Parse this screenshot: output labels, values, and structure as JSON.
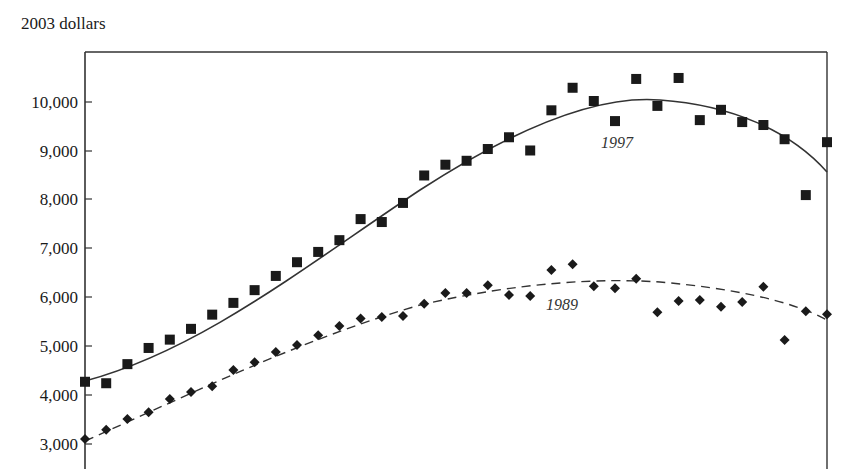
{
  "chart_data": {
    "type": "scatter",
    "title": "",
    "ylabel": "2003 dollars",
    "xlabel": "",
    "ylim": [
      3000,
      11000
    ],
    "yticks": [
      3000,
      4000,
      5000,
      6000,
      7000,
      8000,
      9000,
      10000
    ],
    "ytick_labels": [
      "3,000",
      "4,000",
      "5,000",
      "6,000",
      "7,000",
      "8,000",
      "9,000",
      "10,000"
    ],
    "grid": false,
    "x_index": [
      1,
      2,
      3,
      4,
      5,
      6,
      7,
      8,
      9,
      10,
      11,
      12,
      13,
      14,
      15,
      16,
      17,
      18,
      19,
      20,
      21,
      22,
      23,
      24,
      25,
      26,
      27,
      28,
      29,
      30,
      31,
      32,
      33,
      34,
      35
    ],
    "series": [
      {
        "name": "1997",
        "marker": "square",
        "fit_line": "solid",
        "values": [
          4270,
          4240,
          4630,
          4960,
          5130,
          5350,
          5640,
          5880,
          6140,
          6430,
          6710,
          6920,
          7160,
          7590,
          7530,
          7920,
          8480,
          8700,
          8780,
          9020,
          9260,
          8990,
          9810,
          10270,
          10000,
          9590,
          10450,
          9900,
          10470,
          9610,
          9820,
          9570,
          9510,
          9220,
          8080,
          9160
        ]
      },
      {
        "name": "1989",
        "marker": "diamond",
        "fit_line": "dashed",
        "values": [
          3100,
          3290,
          3510,
          3650,
          3920,
          4060,
          4180,
          4510,
          4670,
          4880,
          5020,
          5220,
          5410,
          5560,
          5590,
          5610,
          5860,
          6080,
          6080,
          6240,
          6040,
          6020,
          6550,
          6670,
          6220,
          6180,
          6370,
          5690,
          5920,
          5940,
          5800,
          5900,
          6210,
          5120,
          5710,
          5650
        ]
      }
    ],
    "annotations": [
      {
        "text": "1997",
        "series": "1997"
      },
      {
        "text": "1989",
        "series": "1989"
      }
    ]
  },
  "header": {
    "unit_label": "2003 dollars"
  },
  "labels": {
    "series_1997": "1997",
    "series_1989": "1989"
  },
  "yaxis": {
    "t10000": "10,000",
    "t9000": "9,000",
    "t8000": "8,000",
    "t7000": "7,000",
    "t6000": "6,000",
    "t5000": "5,000",
    "t4000": "4,000",
    "t3000": "3,000"
  }
}
